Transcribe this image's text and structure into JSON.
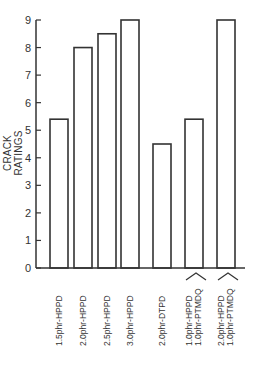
{
  "chart_data": {
    "type": "bar",
    "title": "",
    "xlabel": "",
    "ylabel": "CRACK RATINGS",
    "ylim": [
      0,
      9
    ],
    "yticks": [
      0,
      1,
      2,
      3,
      4,
      5,
      6,
      7,
      8,
      9
    ],
    "grid": false,
    "legend": null,
    "style": "outlined bars, no fill",
    "categories": [
      "1.5phr-HPPD",
      "2.0phr-HPPD",
      "2.5phr-HPPD",
      "3.0phr-HPPD",
      "2.0phr-DTPD",
      "1.0phr-HPPD + 1.0phr-PTMDQ",
      "2.0phr-HPPD + 1.0phr-PTMDQ"
    ],
    "values": [
      5.4,
      8.0,
      8.5,
      9.0,
      4.5,
      5.4,
      9.0
    ]
  },
  "labels": {
    "ylabel": "CRACK RATINGS",
    "x": [
      [
        "1.5phr-HPPD"
      ],
      [
        "2.0phr-HPPD"
      ],
      [
        "2.5phr-HPPD"
      ],
      [
        "3.0phr-HPPD"
      ],
      [
        "2.0phr-DTPD"
      ],
      [
        "1.0phr-HPPD",
        "1.0phr-PTMDQ"
      ],
      [
        "2.0phr-HPPD",
        "1.0phr-PTMDQ"
      ]
    ]
  },
  "colors": {
    "stroke": "#333333",
    "background": "#ffffff"
  }
}
